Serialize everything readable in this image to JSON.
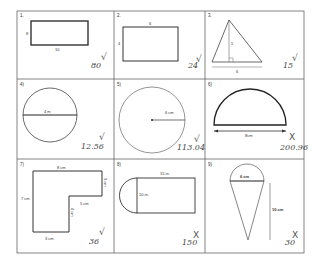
{
  "worksheet": {
    "problems": [
      {
        "number": "1.",
        "shape": "rectangle",
        "labels": {
          "side": "8",
          "bottom": "10"
        },
        "answer": "80",
        "mark": "check"
      },
      {
        "number": "2.",
        "shape": "rectangle",
        "labels": {
          "top": "6",
          "side": "4"
        },
        "answer": "24",
        "mark": "check"
      },
      {
        "number": "3.",
        "shape": "triangle",
        "labels": {
          "height": "5",
          "base": "6"
        },
        "answer": "15",
        "mark": "check"
      },
      {
        "number": "4)",
        "shape": "circle-diameter",
        "labels": {
          "diameter": "4 m"
        },
        "answer": "12.56",
        "mark": "check"
      },
      {
        "number": "5)",
        "shape": "circle-radius",
        "labels": {
          "radius": "6 cm"
        },
        "answer": "113.04",
        "mark": "check"
      },
      {
        "number": "6)",
        "shape": "semicircle",
        "labels": {
          "base": "8cm"
        },
        "answer": "200.96",
        "mark": "cross"
      },
      {
        "number": "7)",
        "shape": "l-shape",
        "labels": {
          "top": "8 cm",
          "right": "3 cm",
          "left": "7 cm",
          "inner_h": "5 cm",
          "inner_v": "4 cm",
          "bottom": "3 cm"
        },
        "answer": "36",
        "mark": "check"
      },
      {
        "number": "8)",
        "shape": "rect-semicircle",
        "labels": {
          "top": "15 in.",
          "side": "10 in."
        },
        "answer": "150",
        "mark": "cross"
      },
      {
        "number": "9)",
        "shape": "cone",
        "labels": {
          "diameter": "6 cm",
          "height": "10 cm"
        },
        "answer": "30",
        "mark": "cross"
      }
    ],
    "marks": {
      "check": "√",
      "cross": "X"
    },
    "colors": {
      "grid": "#555555",
      "shape": "#333333",
      "ink": "#444444"
    }
  }
}
